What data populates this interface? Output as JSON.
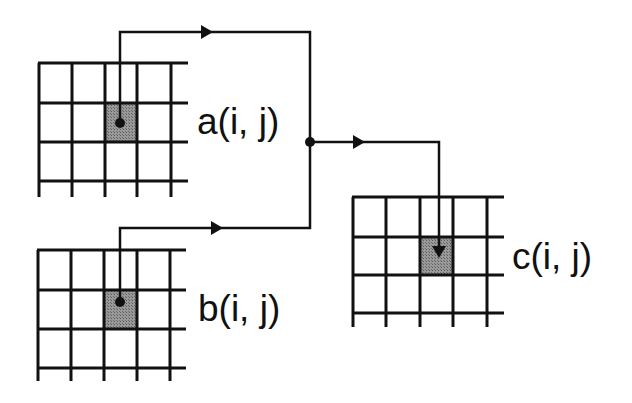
{
  "diagram": {
    "type": "stencil-dataflow",
    "colors": {
      "line": "#111111",
      "shaded_cell": "#8a8a8a",
      "background": "#ffffff"
    },
    "grids": [
      {
        "id": "a",
        "label": "a(i, j)",
        "rows": 3,
        "cols": 5,
        "highlight": "center cell (i, j)",
        "marker": "dot"
      },
      {
        "id": "b",
        "label": "b(i, j)",
        "rows": 3,
        "cols": 5,
        "highlight": "center cell (i, j)",
        "marker": "dot"
      },
      {
        "id": "c",
        "label": "c(i, j)",
        "rows": 3,
        "cols": 5,
        "highlight": "center cell (i, j)",
        "marker": "arrowhead"
      }
    ],
    "edges": [
      {
        "from": "a",
        "to": "junction",
        "direction": "right"
      },
      {
        "from": "b",
        "to": "junction",
        "direction": "right"
      },
      {
        "from": "junction",
        "to": "c",
        "direction": "right-then-down"
      }
    ],
    "junction": {
      "shape": "dot"
    }
  }
}
